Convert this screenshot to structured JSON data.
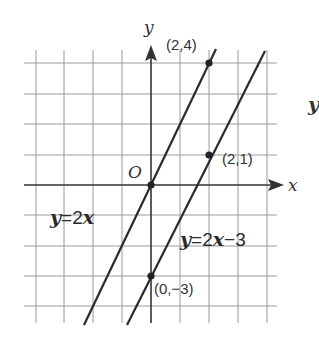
{
  "axes": {
    "x_label": "x",
    "y_label": "y",
    "origin_label": "O"
  },
  "lines": [
    {
      "equation": "y=2x",
      "lhs": "y",
      "eq": "=",
      "coef": "2",
      "var": "x",
      "const": "",
      "slope": 2,
      "intercept": 0
    },
    {
      "equation": "y=2x−3",
      "lhs": "y",
      "eq": "=",
      "coef": "2",
      "var": "x",
      "const": "−3",
      "slope": 2,
      "intercept": -3
    }
  ],
  "points": [
    {
      "label": "(2,4)",
      "x": 2,
      "y": 4
    },
    {
      "label": "(2,1)",
      "x": 2,
      "y": 1
    },
    {
      "label": "(0,−3)",
      "x": 0,
      "y": -3
    },
    {
      "label": "",
      "x": 0,
      "y": 0
    }
  ],
  "side_fragment": "y",
  "grid": {
    "x_range": [
      -4,
      4
    ],
    "y_range": [
      -4,
      4
    ],
    "unit": 1
  }
}
